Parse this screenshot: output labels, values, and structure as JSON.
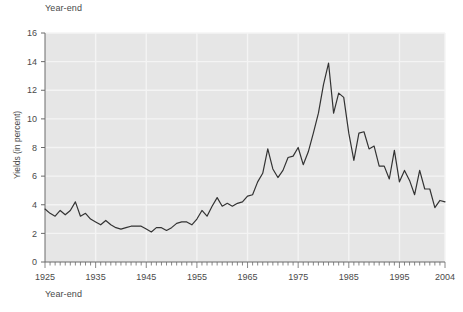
{
  "chart_data": {
    "type": "line",
    "title": "Year-end",
    "xlabel": "Year-end",
    "ylabel": "Yields (in percent)",
    "xlim": [
      1925,
      2004
    ],
    "ylim": [
      0,
      16
    ],
    "yticks": [
      0,
      2,
      4,
      6,
      8,
      10,
      12,
      14,
      16
    ],
    "xticks": [
      1925,
      1935,
      1945,
      1955,
      1965,
      1975,
      1985,
      1995,
      2004
    ],
    "grid": true,
    "legend": "none",
    "line_color": "#333333",
    "plot_bg": "#e6e6e6",
    "grid_color": "#f4f4f4",
    "series": [
      {
        "name": "Year-end yields",
        "x": [
          1925,
          1926,
          1927,
          1928,
          1929,
          1930,
          1931,
          1932,
          1933,
          1934,
          1935,
          1936,
          1937,
          1938,
          1939,
          1940,
          1941,
          1942,
          1943,
          1944,
          1945,
          1946,
          1947,
          1948,
          1949,
          1950,
          1951,
          1952,
          1953,
          1954,
          1955,
          1956,
          1957,
          1958,
          1959,
          1960,
          1961,
          1962,
          1963,
          1964,
          1965,
          1966,
          1967,
          1968,
          1969,
          1970,
          1971,
          1972,
          1973,
          1974,
          1975,
          1976,
          1977,
          1978,
          1979,
          1980,
          1981,
          1982,
          1983,
          1984,
          1985,
          1986,
          1987,
          1988,
          1989,
          1990,
          1991,
          1992,
          1993,
          1994,
          1995,
          1996,
          1997,
          1998,
          1999,
          2000,
          2001,
          2002,
          2003,
          2004
        ],
        "values": [
          3.7,
          3.4,
          3.2,
          3.6,
          3.3,
          3.6,
          4.2,
          3.2,
          3.4,
          3.0,
          2.8,
          2.6,
          2.9,
          2.6,
          2.4,
          2.3,
          2.4,
          2.5,
          2.5,
          2.5,
          2.3,
          2.1,
          2.4,
          2.4,
          2.2,
          2.4,
          2.7,
          2.8,
          2.8,
          2.6,
          3.0,
          3.6,
          3.2,
          3.9,
          4.5,
          3.9,
          4.1,
          3.9,
          4.1,
          4.2,
          4.6,
          4.7,
          5.6,
          6.2,
          7.9,
          6.5,
          5.9,
          6.4,
          7.3,
          7.4,
          8.0,
          6.8,
          7.7,
          9.0,
          10.4,
          12.4,
          13.9,
          10.4,
          11.8,
          11.5,
          9.0,
          7.1,
          9.0,
          9.1,
          7.9,
          8.1,
          6.7,
          6.7,
          5.8,
          7.8,
          5.6,
          6.4,
          5.7,
          4.7,
          6.4,
          5.1,
          5.1,
          3.8,
          4.3,
          4.2
        ]
      }
    ]
  },
  "axis": {
    "y_tick_labels": [
      "16",
      "14",
      "12",
      "10",
      "8",
      "6",
      "4",
      "2",
      "0"
    ],
    "x_tick_labels": [
      "1925",
      "1935",
      "1945",
      "1955",
      "1965",
      "1975",
      "1985",
      "1995",
      "2004"
    ]
  }
}
